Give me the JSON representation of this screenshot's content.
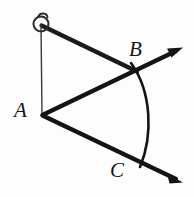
{
  "figure": {
    "kind": "geometry-diagram",
    "background_color": "#fdfdfd",
    "ink_color": "#141414",
    "canvas": {
      "width": 194,
      "height": 197
    },
    "labels": [
      {
        "id": "A",
        "text": "A",
        "x": 14,
        "y": 100
      },
      {
        "id": "B",
        "text": "B",
        "x": 129,
        "y": 39
      },
      {
        "id": "C",
        "text": "C",
        "x": 110,
        "y": 160
      }
    ],
    "points": {
      "vertex_A": {
        "x": 42,
        "y": 115
      },
      "compass_pivot": {
        "x": 41,
        "y": 25
      },
      "crossing_B": {
        "x": 135,
        "y": 70
      },
      "crossing_C": {
        "x": 137,
        "y": 160
      },
      "arrow_tip_upper": {
        "x": 182,
        "y": 48
      },
      "arrow_tip_lower": {
        "x": 182,
        "y": 182
      }
    },
    "strokes": {
      "ray_width": 4.2,
      "thin_line_width": 1.4,
      "arc_width": 2.6,
      "compass_circle_radius": 7.5,
      "compass_circle_width": 2.0
    },
    "elements": [
      {
        "name": "compass-circle",
        "type": "circle"
      },
      {
        "name": "compass-tick",
        "type": "hook"
      },
      {
        "name": "compass-leg-line",
        "type": "thin-segment"
      },
      {
        "name": "compass-arm-segment",
        "type": "thick-segment"
      },
      {
        "name": "ray-AB",
        "type": "thick-ray-with-arrowhead"
      },
      {
        "name": "ray-AC",
        "type": "thick-ray-with-arrowhead"
      },
      {
        "name": "construction-arc",
        "type": "arc"
      }
    ]
  }
}
